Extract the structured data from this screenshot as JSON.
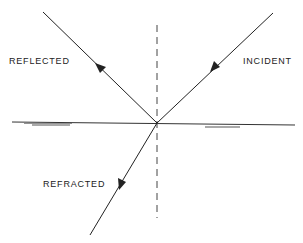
{
  "diagram": {
    "labels": {
      "reflected": "REFLECTED",
      "incident": "INCIDENT",
      "refracted": "REFRACTED"
    },
    "colors": {
      "line": "#222222",
      "background": "#ffffff"
    },
    "rays": [
      {
        "name": "incident",
        "from": [
          273,
          13
        ],
        "to": [
          157,
          123
        ],
        "arrow_at": [
          218,
          65
        ]
      },
      {
        "name": "reflected",
        "from": [
          157,
          123
        ],
        "to": [
          43,
          12
        ],
        "arrow_at": [
          100,
          68
        ]
      },
      {
        "name": "refracted",
        "from": [
          157,
          123
        ],
        "to": [
          90,
          235
        ],
        "arrow_at": [
          121,
          183
        ]
      }
    ],
    "normal": {
      "x": 157,
      "y1": 25,
      "y2": 218,
      "style": "dashed"
    },
    "surface": {
      "x1": 12,
      "y1": 122,
      "x2": 295,
      "y2": 125
    }
  }
}
